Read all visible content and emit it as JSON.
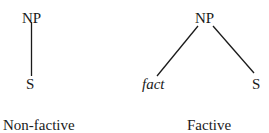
{
  "diagram": {
    "trees": [
      {
        "root": "NP",
        "children": [
          "S"
        ],
        "caption": "Non-factive"
      },
      {
        "root": "NP",
        "children": [
          "fact",
          "S"
        ],
        "caption": "Factive"
      }
    ]
  }
}
